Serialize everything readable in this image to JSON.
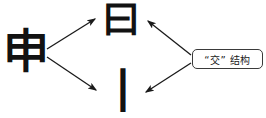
{
  "diagram": {
    "background_color": "#ffffff",
    "stroke_color": "#1a1a1a",
    "nodes": {
      "source": {
        "id": "node-shen",
        "text": "申",
        "role": "source character",
        "position": {
          "x": 2,
          "y": 28
        }
      },
      "component_top": {
        "id": "node-yue",
        "text": "曰",
        "role": "upper component",
        "position": {
          "x": 100,
          "y": 0
        }
      },
      "component_bottom": {
        "id": "node-shu",
        "text": "丨",
        "role": "lower component",
        "position": {
          "x": 100,
          "y": 68
        }
      }
    },
    "label": {
      "id": "label-jiao-jiegou",
      "text": "“交” 结构",
      "border_color": "#3a3a3a",
      "fill_color": "#ffffff",
      "text_color": "#1a1a1a",
      "position": {
        "x": 192,
        "y": 49,
        "width": 71,
        "height": 20
      }
    },
    "arrows": [
      {
        "id": "arrow-shen-to-yue",
        "from": "source",
        "to": "component_top",
        "x1": 47,
        "y1": 49,
        "x2": 95,
        "y2": 19
      },
      {
        "id": "arrow-shen-to-shu",
        "from": "source",
        "to": "component_bottom",
        "x1": 47,
        "y1": 57,
        "x2": 96,
        "y2": 90
      },
      {
        "id": "arrow-label-to-yue",
        "from": "label",
        "to": "component_top",
        "x1": 191,
        "y1": 55,
        "x2": 148,
        "y2": 21
      },
      {
        "id": "arrow-label-to-shu",
        "from": "label",
        "to": "component_bottom",
        "x1": 191,
        "y1": 63,
        "x2": 146,
        "y2": 92
      }
    ]
  }
}
